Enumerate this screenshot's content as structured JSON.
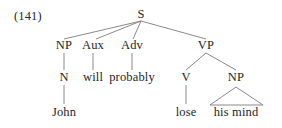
{
  "figure": {
    "example_number": "(141)",
    "kind": "syntax-tree",
    "sentence": "John will probably lose his mind",
    "ink_color": "#262626",
    "line_color": "#7d7d7d"
  },
  "tree": {
    "nodes": [
      {
        "id": "s",
        "label": "S",
        "x": 141,
        "y": 14,
        "level": 0,
        "type": "category"
      },
      {
        "id": "np1",
        "label": "NP",
        "x": 64,
        "y": 45,
        "level": 1,
        "type": "category"
      },
      {
        "id": "aux",
        "label": "Aux",
        "x": 93,
        "y": 45,
        "level": 1,
        "type": "category"
      },
      {
        "id": "adv",
        "label": "Adv",
        "x": 132,
        "y": 45,
        "level": 1,
        "type": "category"
      },
      {
        "id": "vp",
        "label": "VP",
        "x": 206,
        "y": 45,
        "level": 1,
        "type": "category"
      },
      {
        "id": "n",
        "label": "N",
        "x": 64,
        "y": 77,
        "level": 2,
        "type": "category"
      },
      {
        "id": "will",
        "label": "will",
        "x": 93,
        "y": 77,
        "level": 2,
        "type": "terminal"
      },
      {
        "id": "probably",
        "label": "probably",
        "x": 132,
        "y": 77,
        "level": 2,
        "type": "terminal"
      },
      {
        "id": "v",
        "label": "V",
        "x": 186,
        "y": 77,
        "level": 2,
        "type": "category"
      },
      {
        "id": "np2",
        "label": "NP",
        "x": 236,
        "y": 77,
        "level": 2,
        "type": "category"
      },
      {
        "id": "john",
        "label": "John",
        "x": 64,
        "y": 112,
        "level": 3,
        "type": "terminal"
      },
      {
        "id": "lose",
        "label": "lose",
        "x": 186,
        "y": 112,
        "level": 3,
        "type": "terminal"
      },
      {
        "id": "hismind",
        "label": "his mind",
        "x": 236,
        "y": 112,
        "level": 3,
        "type": "terminal"
      }
    ],
    "edges": [
      {
        "from": "s",
        "to": "np1",
        "x1": 141,
        "y1": 21,
        "x2": 64,
        "y2": 39
      },
      {
        "from": "s",
        "to": "aux",
        "x1": 141,
        "y1": 21,
        "x2": 96,
        "y2": 39
      },
      {
        "from": "s",
        "to": "adv",
        "x1": 141,
        "y1": 21,
        "x2": 133,
        "y2": 39
      },
      {
        "from": "s",
        "to": "vp",
        "x1": 141,
        "y1": 21,
        "x2": 206,
        "y2": 39
      },
      {
        "from": "np1",
        "to": "n",
        "x1": 64,
        "y1": 53,
        "x2": 64,
        "y2": 70
      },
      {
        "from": "aux",
        "to": "will",
        "x1": 93,
        "y1": 53,
        "x2": 93,
        "y2": 70
      },
      {
        "from": "adv",
        "to": "probably",
        "x1": 132,
        "y1": 53,
        "x2": 132,
        "y2": 70
      },
      {
        "from": "vp",
        "to": "v",
        "x1": 206,
        "y1": 53,
        "x2": 186,
        "y2": 70
      },
      {
        "from": "vp",
        "to": "np2",
        "x1": 206,
        "y1": 53,
        "x2": 236,
        "y2": 70
      },
      {
        "from": "n",
        "to": "john",
        "x1": 64,
        "y1": 85,
        "x2": 64,
        "y2": 104
      },
      {
        "from": "v",
        "to": "lose",
        "x1": 186,
        "y1": 85,
        "x2": 186,
        "y2": 104
      }
    ],
    "triangles": [
      {
        "from": "np2",
        "to": "hismind",
        "apex_x": 236,
        "apex_y": 87,
        "left_x": 210,
        "right_x": 263,
        "base_y": 105
      }
    ]
  }
}
